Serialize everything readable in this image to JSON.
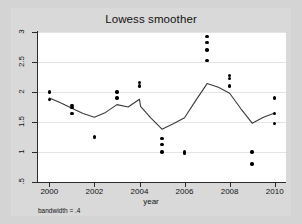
{
  "chart_data": {
    "type": "scatter",
    "title": "Lowess smoother",
    "xlabel": "year",
    "ylabel": "",
    "annotation": "bandwidth = .4",
    "xlim": [
      1999.5,
      2010.5
    ],
    "ylim": [
      0.5,
      3.0
    ],
    "grid": true,
    "legend": "none",
    "xticks": [
      "2000",
      "2002",
      "2004",
      "2006",
      "2008",
      "2010"
    ],
    "xtick_values": [
      2000,
      2002,
      2004,
      2006,
      2008,
      2010
    ],
    "yticks": [
      ".5",
      "1",
      "1.5",
      "2",
      "2.5",
      "3"
    ],
    "ytick_values": [
      0.5,
      1,
      1.5,
      2,
      2.5,
      3
    ],
    "point_color": "#000000",
    "line_color": "#3a3a3a",
    "plot_bg": "#ffffff",
    "figure_bg": "#d4d4d4",
    "scatter": {
      "x": [
        2000,
        2000,
        2001,
        2001,
        2001,
        2002,
        2002,
        2003,
        2003,
        2004,
        2004,
        2005,
        2005,
        2005,
        2006,
        2006,
        2007,
        2007,
        2007,
        2007,
        2008,
        2008,
        2008,
        2009,
        2009,
        2010,
        2010,
        2010
      ],
      "y": [
        2.0,
        1.88,
        1.78,
        1.74,
        1.64,
        1.26,
        1.24,
        2.0,
        1.9,
        2.16,
        2.1,
        1.22,
        1.12,
        1.0,
        1.0,
        0.98,
        2.93,
        2.82,
        2.7,
        2.52,
        2.28,
        2.22,
        2.1,
        1.0,
        0.8,
        1.9,
        1.64,
        1.48
      ]
    },
    "series": [
      {
        "name": "lowess smooth",
        "type": "line",
        "x": [
          2000,
          2000.5,
          2001,
          2001.5,
          2002,
          2002.5,
          2003,
          2003.5,
          2004,
          2004.05,
          2004.5,
          2005,
          2005.5,
          2006,
          2006.5,
          2007,
          2007.5,
          2008,
          2008.5,
          2009,
          2009.5,
          2010
        ],
        "y": [
          1.9,
          1.82,
          1.73,
          1.64,
          1.58,
          1.66,
          1.79,
          1.75,
          1.88,
          1.76,
          1.57,
          1.38,
          1.47,
          1.57,
          1.86,
          2.14,
          2.08,
          1.98,
          1.72,
          1.48,
          1.58,
          1.65
        ]
      }
    ]
  }
}
